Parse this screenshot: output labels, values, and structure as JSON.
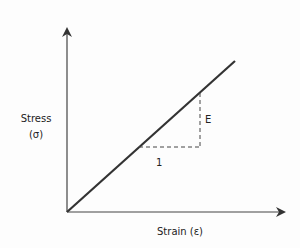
{
  "diagram": {
    "y_axis": {
      "label_line1": "Stress",
      "label_line2": "(σ)"
    },
    "x_axis": {
      "label": "Strain (ε)"
    },
    "slope_triangle": {
      "rise_label": "E",
      "run_label": "1"
    },
    "colors": {
      "axis": "#444444",
      "line": "#333333",
      "dashed": "#444444",
      "background": "#fdfdfd"
    }
  }
}
